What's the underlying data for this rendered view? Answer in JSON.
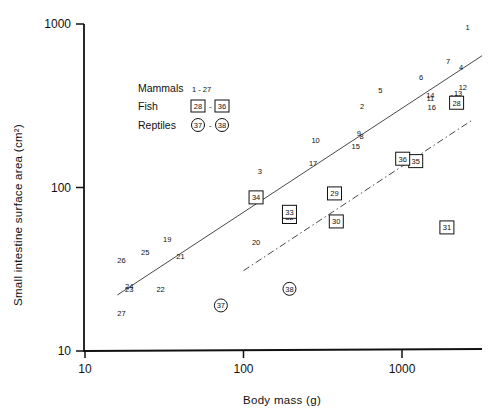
{
  "chart_data": {
    "type": "scatter",
    "title": "",
    "xlabel": "Body mass (g)",
    "ylabel": "Small intestine surface area (cm²)",
    "xscale": "log",
    "yscale": "log",
    "xlim": [
      10,
      3500
    ],
    "ylim": [
      10,
      1000
    ],
    "xticks": [
      10,
      100,
      1000
    ],
    "xtick_labels": [
      "10",
      "100",
      "1000"
    ],
    "yticks": [
      10,
      100,
      1000
    ],
    "ytick_labels": [
      "10",
      "100",
      "1000"
    ],
    "grid": false,
    "legend": {
      "position": "upper-left",
      "entries": [
        {
          "label": "Mammals",
          "range": "1 - 27",
          "marker": "none"
        },
        {
          "label": "Fish",
          "range_start": "28",
          "range_end": "36",
          "marker": "square"
        },
        {
          "label": "Reptiles",
          "range_start": "37",
          "range_end": "38",
          "marker": "circle"
        }
      ]
    },
    "series": [
      {
        "name": "Mammals",
        "marker": "none",
        "points": [
          {
            "id": "1",
            "x": 2590,
            "y": 950
          },
          {
            "id": "2",
            "x": 560,
            "y": 315
          },
          {
            "id": "3",
            "x": 127,
            "y": 125
          },
          {
            "id": "4",
            "x": 2360,
            "y": 545
          },
          {
            "id": "5",
            "x": 730,
            "y": 395
          },
          {
            "id": "6",
            "x": 1320,
            "y": 475
          },
          {
            "id": "7",
            "x": 1950,
            "y": 595
          },
          {
            "id": "8",
            "x": 555,
            "y": 205
          },
          {
            "id": "9",
            "x": 535,
            "y": 215
          },
          {
            "id": "10",
            "x": 285,
            "y": 195
          },
          {
            "id": "11",
            "x": 1510,
            "y": 350
          },
          {
            "id": "12",
            "x": 2420,
            "y": 410
          },
          {
            "id": "13",
            "x": 2260,
            "y": 375
          },
          {
            "id": "14",
            "x": 1510,
            "y": 365
          },
          {
            "id": "15",
            "x": 510,
            "y": 180
          },
          {
            "id": "16",
            "x": 1540,
            "y": 310
          },
          {
            "id": "17",
            "x": 275,
            "y": 140
          },
          {
            "id": "18",
            "x": 2130,
            "y": 355
          },
          {
            "id": "19",
            "x": 33,
            "y": 48
          },
          {
            "id": "20",
            "x": 120,
            "y": 46
          },
          {
            "id": "21",
            "x": 40,
            "y": 38
          },
          {
            "id": "22",
            "x": 30,
            "y": 24
          },
          {
            "id": "23",
            "x": 19,
            "y": 24
          },
          {
            "id": "24",
            "x": 19,
            "y": 25
          },
          {
            "id": "25",
            "x": 24,
            "y": 40
          },
          {
            "id": "26",
            "x": 17,
            "y": 36
          },
          {
            "id": "27",
            "x": 17,
            "y": 17
          }
        ]
      },
      {
        "name": "Fish",
        "marker": "square",
        "points": [
          {
            "id": "28",
            "x": 2210,
            "y": 330
          },
          {
            "id": "29",
            "x": 375,
            "y": 92
          },
          {
            "id": "30",
            "x": 385,
            "y": 62
          },
          {
            "id": "31",
            "x": 1920,
            "y": 57
          },
          {
            "id": "32",
            "x": 195,
            "y": 66
          },
          {
            "id": "33",
            "x": 195,
            "y": 71
          },
          {
            "id": "34",
            "x": 120,
            "y": 87
          },
          {
            "id": "35",
            "x": 1220,
            "y": 145
          },
          {
            "id": "36",
            "x": 1010,
            "y": 150
          }
        ]
      },
      {
        "name": "Reptiles",
        "marker": "circle",
        "points": [
          {
            "id": "37",
            "x": 72,
            "y": 19
          },
          {
            "id": "38",
            "x": 195,
            "y": 24
          }
        ]
      }
    ],
    "lines": [
      {
        "name": "mammal-regression",
        "style": "solid",
        "x": [
          16,
          3200
        ],
        "y": [
          22,
          640
        ]
      },
      {
        "name": "fish-regression",
        "style": "dash-dot",
        "x": [
          100,
          2800
        ],
        "y": [
          31,
          260
        ]
      }
    ]
  }
}
